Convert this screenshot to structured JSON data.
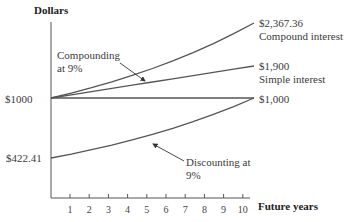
{
  "chart_data": {
    "type": "line",
    "title": "",
    "xlabel": "Future years",
    "ylabel": "Dollars",
    "x": [
      0,
      1,
      2,
      3,
      4,
      5,
      6,
      7,
      8,
      9,
      10
    ],
    "xticks": [
      "1",
      "2",
      "3",
      "4",
      "5",
      "6",
      "7",
      "8",
      "9",
      "10"
    ],
    "y_tick_labels": [
      "$1000",
      "$422.41"
    ],
    "series": [
      {
        "name": "Compound interest",
        "end_label": "$2,367.36",
        "values": [
          1000,
          1090,
          1188.1,
          1295.03,
          1411.58,
          1538.62,
          1677.1,
          1828.04,
          1992.56,
          2171.89,
          2367.36
        ]
      },
      {
        "name": "Simple interest",
        "end_label": "$1,900",
        "values": [
          1000,
          1090,
          1180,
          1270,
          1360,
          1450,
          1540,
          1630,
          1720,
          1810,
          1900
        ]
      },
      {
        "name": "Principal",
        "end_label": "$1,000",
        "values": [
          1000,
          1000,
          1000,
          1000,
          1000,
          1000,
          1000,
          1000,
          1000,
          1000,
          1000
        ]
      },
      {
        "name": "Discounting at 9%",
        "start_label": "$422.41",
        "values": [
          422.41,
          460.43,
          501.87,
          547.03,
          596.27,
          649.93,
          708.43,
          772.18,
          841.68,
          917.43,
          1000
        ]
      }
    ],
    "annotations": [
      "Compounding at 9%",
      "Discounting at 9%"
    ],
    "grid": false,
    "legend": "none (inline labels)"
  },
  "labels": {
    "ylabel": "Dollars",
    "xlabel": "Future years",
    "y1000": "$1000",
    "y422": "$422.41",
    "compound_value": "$2,367.36",
    "compound_name": "Compound interest",
    "simple_value": "$1,900",
    "simple_name": "Simple interest",
    "principal_value": "$1,000",
    "compounding_note_1": "Compounding",
    "compounding_note_2": "at 9%",
    "discounting_note_1": "Discounting at",
    "discounting_note_2": "9%"
  },
  "ticks": [
    "1",
    "2",
    "3",
    "4",
    "5",
    "6",
    "7",
    "8",
    "9",
    "10"
  ]
}
